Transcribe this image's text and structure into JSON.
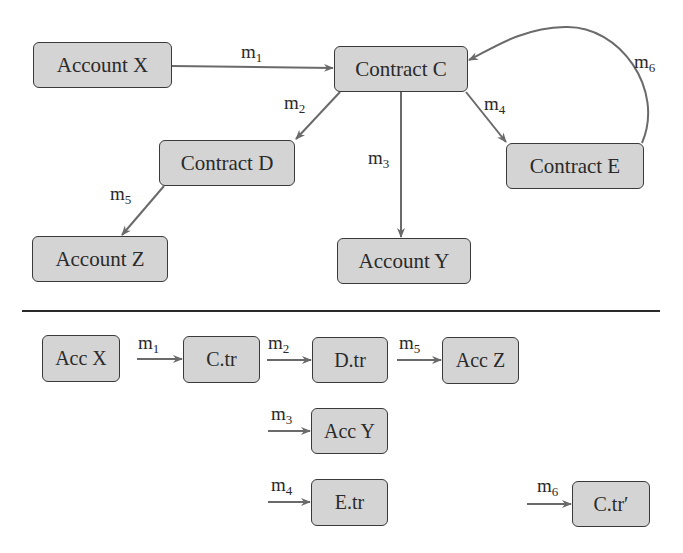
{
  "diagram": {
    "top": {
      "nodes": {
        "account_x": "Account X",
        "contract_c": "Contract C",
        "contract_d": "Contract D",
        "contract_e": "Contract E",
        "account_z": "Account Z",
        "account_y": "Account Y"
      },
      "edges": [
        {
          "from": "Account X",
          "to": "Contract C",
          "label": "m",
          "sub": "1"
        },
        {
          "from": "Contract C",
          "to": "Contract D",
          "label": "m",
          "sub": "2"
        },
        {
          "from": "Contract C",
          "to": "Account Y",
          "label": "m",
          "sub": "3"
        },
        {
          "from": "Contract C",
          "to": "Contract E",
          "label": "m",
          "sub": "4"
        },
        {
          "from": "Contract D",
          "to": "Account Z",
          "label": "m",
          "sub": "5"
        },
        {
          "from": "Contract E",
          "to": "Contract C",
          "label": "m",
          "sub": "6"
        }
      ]
    },
    "bottom": {
      "nodes": {
        "acc_x": "Acc X",
        "c_tr": "C.tr",
        "d_tr": "D.tr",
        "acc_z": "Acc Z",
        "acc_y": "Acc Y",
        "e_tr": "E.tr",
        "c_tr_prime": "C.tr′"
      },
      "edges": [
        {
          "to": "C.tr",
          "label": "m",
          "sub": "1"
        },
        {
          "to": "D.tr",
          "label": "m",
          "sub": "2"
        },
        {
          "to": "Acc Z",
          "label": "m",
          "sub": "5"
        },
        {
          "to": "Acc Y",
          "label": "m",
          "sub": "3"
        },
        {
          "to": "E.tr",
          "label": "m",
          "sub": "4"
        },
        {
          "to": "C.tr′",
          "label": "m",
          "sub": "6"
        }
      ]
    },
    "colors": {
      "node_fill": "#d4d4d4",
      "node_border": "#3a3a3a",
      "edge": "#6a6a6a",
      "divider": "#2a2a2a"
    }
  }
}
